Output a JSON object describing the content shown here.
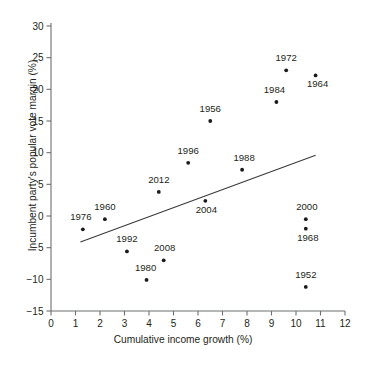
{
  "chart_data": {
    "type": "scatter",
    "title": "",
    "xlabel": "Cumulative income growth (%)",
    "ylabel": "Incumbent party's popular vote margin (%)",
    "xlim": [
      0,
      12
    ],
    "ylim": [
      -15,
      30
    ],
    "xticks": [
      0,
      1,
      2,
      3,
      4,
      5,
      6,
      7,
      8,
      9,
      10,
      11,
      12
    ],
    "yticks": [
      -15,
      -10,
      -5,
      0,
      5,
      10,
      15,
      20,
      25,
      30
    ],
    "xtick_labels": [
      "0",
      "1",
      "2",
      "3",
      "4",
      "5",
      "6",
      "7",
      "8",
      "9",
      "10",
      "11",
      "12"
    ],
    "ytick_labels": [
      "−15",
      "−10",
      "−5",
      "0",
      "5",
      "10",
      "15",
      "20",
      "25",
      "30"
    ],
    "grid": false,
    "legend": "none",
    "marker_color": "#1a1a1a",
    "line_color": "#3a3a3a",
    "points": [
      {
        "label": "1972",
        "x": 9.6,
        "y": 23.0,
        "label_dx": 0,
        "label_dy": -9
      },
      {
        "label": "1964",
        "x": 10.8,
        "y": 22.2,
        "label_dx": 2,
        "label_dy": 12
      },
      {
        "label": "1984",
        "x": 9.2,
        "y": 18.0,
        "label_dx": -2,
        "label_dy": -9
      },
      {
        "label": "1956",
        "x": 6.5,
        "y": 15.0,
        "label_dx": 0,
        "label_dy": -9
      },
      {
        "label": "1996",
        "x": 5.6,
        "y": 8.4,
        "label_dx": 0,
        "label_dy": -9
      },
      {
        "label": "1988",
        "x": 7.8,
        "y": 7.3,
        "label_dx": 2,
        "label_dy": -9
      },
      {
        "label": "2012",
        "x": 4.4,
        "y": 3.8,
        "label_dx": 0,
        "label_dy": -9
      },
      {
        "label": "2004",
        "x": 6.3,
        "y": 2.4,
        "label_dx": 1,
        "label_dy": 12
      },
      {
        "label": "1960",
        "x": 2.2,
        "y": -0.5,
        "label_dx": 0,
        "label_dy": -9
      },
      {
        "label": "2000",
        "x": 10.4,
        "y": -0.5,
        "label_dx": 1,
        "label_dy": -9
      },
      {
        "label": "1968",
        "x": 10.4,
        "y": -2.0,
        "label_dx": 2,
        "label_dy": 12
      },
      {
        "label": "1976",
        "x": 1.3,
        "y": -2.1,
        "label_dx": -2,
        "label_dy": -9
      },
      {
        "label": "1992",
        "x": 3.1,
        "y": -5.6,
        "label_dx": 0,
        "label_dy": -9
      },
      {
        "label": "2008",
        "x": 4.6,
        "y": -7.0,
        "label_dx": 1,
        "label_dy": -9
      },
      {
        "label": "1980",
        "x": 3.9,
        "y": -10.1,
        "label_dx": -1,
        "label_dy": -9
      },
      {
        "label": "1952",
        "x": 10.4,
        "y": -11.2,
        "label_dx": 0,
        "label_dy": -9
      }
    ],
    "trendline": {
      "x0": 1.2,
      "y0": -4.1,
      "x1": 10.8,
      "y1": 9.6
    }
  },
  "caption": {
    "text": ""
  }
}
